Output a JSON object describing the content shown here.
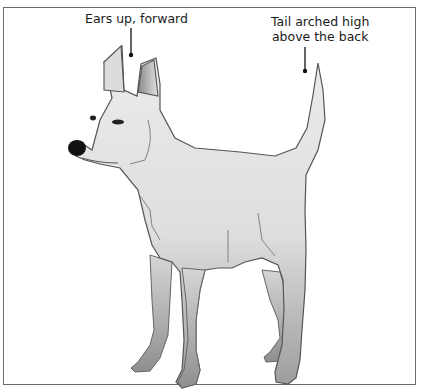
{
  "figure": {
    "annotations": [
      {
        "id": "ears",
        "text": "Ears up, forward"
      },
      {
        "id": "tail",
        "line1": "Tail arched high",
        "line2": "above the back"
      }
    ],
    "colors": {
      "border": "#6d6d6d",
      "fur_light": "#e6e6e6",
      "fur_dark": "#9a9a9a",
      "outline": "#555555",
      "nose": "#111111"
    }
  }
}
